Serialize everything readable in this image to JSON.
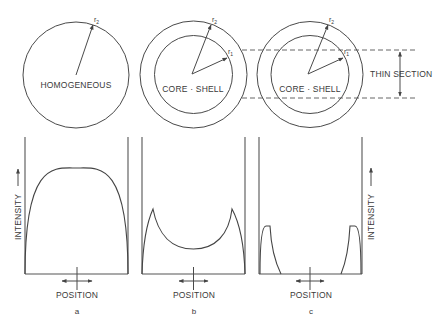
{
  "panels": [
    {
      "id": "a",
      "caption": "a",
      "particle_label": "HOMOGENEOUS",
      "radius_labels": {
        "outer": "r",
        "outer_sub": "2"
      },
      "position_label": "POSITION",
      "intensity_label": "INTENSITY",
      "profile": "dome"
    },
    {
      "id": "b",
      "caption": "b",
      "particle_label": "CORE · SHELL",
      "radius_labels": {
        "outer": "r",
        "outer_sub": "2",
        "inner": "r",
        "inner_sub": "1"
      },
      "position_label": "POSITION",
      "profile": "shell-peaks"
    },
    {
      "id": "c",
      "caption": "c",
      "particle_label": "CORE · SHELL",
      "radius_labels": {
        "outer": "r",
        "outer_sub": "2",
        "inner": "r",
        "inner_sub": "1"
      },
      "position_label": "POSITION",
      "intensity_label": "INTENSITY",
      "thin_section_label": "THIN SECTION",
      "profile": "thin-section-peaks"
    }
  ],
  "colors": {
    "stroke": "#444444",
    "text": "#3a3a3a",
    "background": "#ffffff"
  }
}
